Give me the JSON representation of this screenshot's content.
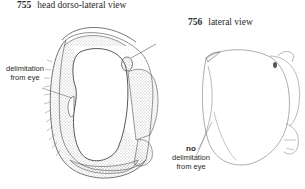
{
  "figures": [
    {
      "number": "755",
      "caption": "head  dorso-lateral view",
      "annotation": {
        "emphasis": "",
        "text_line1": "delimitation",
        "text_line2": "from eye"
      }
    },
    {
      "number": "756",
      "caption": "lateral view",
      "annotation": {
        "emphasis": "no",
        "text_line1": "delimitation",
        "text_line2": "from eye"
      }
    }
  ],
  "colors": {
    "ink": "#2a2a2a",
    "stipple": "#8a8a8a",
    "outline": "#9a9a9a",
    "background": "#ffffff"
  }
}
